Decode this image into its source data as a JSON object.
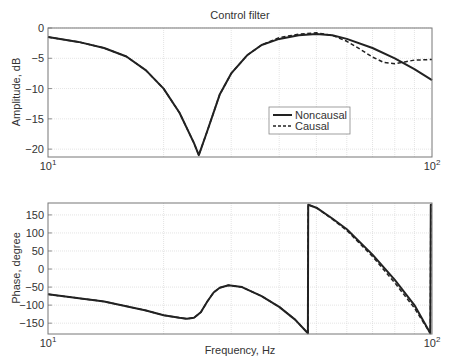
{
  "figure": {
    "title": "Control filter"
  },
  "chart_data": [
    {
      "type": "line",
      "title": "Control filter",
      "xlabel": "",
      "ylabel": "Amplitude, dB",
      "xscale": "log",
      "xlim": [
        10,
        100
      ],
      "ylim": [
        -21.3,
        0
      ],
      "xticks": [
        {
          "v": 10,
          "label": "10",
          "exp": "1"
        },
        {
          "v": 100,
          "label": "10",
          "exp": "2"
        }
      ],
      "yticks": [
        0,
        -5,
        -10,
        -15,
        -20
      ],
      "grid": true,
      "legend": {
        "position": "inside-lower-right",
        "entries": [
          "Noncausal",
          "Causal"
        ]
      },
      "series": [
        {
          "name": "Noncausal",
          "style": "solid",
          "x": [
            10,
            12,
            14,
            16,
            18,
            20,
            22,
            24,
            24.7,
            26,
            28,
            30,
            33,
            36,
            40,
            45,
            50,
            55,
            60,
            70,
            80,
            90,
            100
          ],
          "y": [
            -1.5,
            -2.3,
            -3.3,
            -4.7,
            -7,
            -10,
            -14,
            -19,
            -21,
            -17,
            -11,
            -7.5,
            -4.5,
            -2.8,
            -1.8,
            -1.2,
            -1.0,
            -1.2,
            -1.8,
            -3.3,
            -5.0,
            -6.8,
            -8.6
          ]
        },
        {
          "name": "Causal",
          "style": "dashed",
          "x": [
            10,
            12,
            14,
            16,
            18,
            20,
            22,
            24,
            24.7,
            26,
            28,
            30,
            33,
            36,
            40,
            45,
            50,
            55,
            60,
            65,
            70,
            75,
            80,
            85,
            90,
            100
          ],
          "y": [
            -1.5,
            -2.3,
            -3.3,
            -4.7,
            -7,
            -10,
            -14,
            -19,
            -21,
            -17,
            -11,
            -7.5,
            -4.5,
            -2.8,
            -1.6,
            -1.0,
            -0.8,
            -1.2,
            -2.2,
            -3.5,
            -4.8,
            -5.7,
            -5.9,
            -5.6,
            -5.3,
            -5.2
          ]
        }
      ]
    },
    {
      "type": "line",
      "title": "",
      "xlabel": "Frequency, Hz",
      "ylabel": "Phase, degree",
      "xscale": "log",
      "xlim": [
        10,
        100
      ],
      "ylim": [
        -180,
        183
      ],
      "xticks": [
        {
          "v": 10,
          "label": "10",
          "exp": "1"
        },
        {
          "v": 100,
          "label": "10",
          "exp": "2"
        }
      ],
      "yticks": [
        150,
        100,
        50,
        0,
        -50,
        -100,
        -150
      ],
      "grid": true,
      "series": [
        {
          "name": "Noncausal",
          "style": "solid",
          "x": [
            10,
            14,
            18,
            20,
            22,
            23,
            24,
            25,
            26,
            27,
            28,
            29.5,
            32,
            36,
            40,
            44,
            47.5,
            47.6,
            50,
            55,
            60,
            70,
            80,
            90,
            99,
            99.3,
            100
          ],
          "y": [
            -70,
            -90,
            -115,
            -128,
            -135,
            -138,
            -135,
            -120,
            -90,
            -65,
            -52,
            -45,
            -50,
            -75,
            -105,
            -140,
            -178,
            178,
            170,
            140,
            110,
            40,
            -30,
            -100,
            -178,
            178,
            178
          ]
        },
        {
          "name": "Causal",
          "style": "dashed",
          "x": [
            10,
            14,
            18,
            20,
            22,
            23,
            24,
            25,
            26,
            27,
            28,
            29.5,
            32,
            36,
            40,
            44,
            47.5,
            47.6,
            50,
            55,
            60,
            70,
            80,
            90,
            99,
            99.3,
            100
          ],
          "y": [
            -70,
            -90,
            -115,
            -128,
            -135,
            -138,
            -135,
            -120,
            -90,
            -65,
            -52,
            -45,
            -50,
            -75,
            -105,
            -140,
            -178,
            178,
            170,
            138,
            107,
            35,
            -38,
            -108,
            -178,
            178,
            178
          ]
        }
      ]
    }
  ]
}
